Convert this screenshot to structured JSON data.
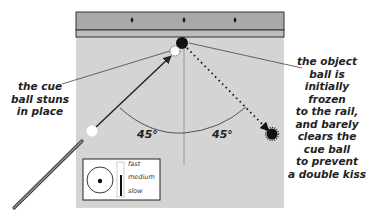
{
  "diagram": {
    "type": "billiards-shot",
    "colors": {
      "background": "#ffffff",
      "felt": "#d4d4d4",
      "rail": "#a9a9a9",
      "cushion": "#bdbdbd",
      "outline": "#333333",
      "object_ball": "#111111",
      "cue_ball": "#ffffff",
      "text": "#222222"
    },
    "rail": {
      "diamonds": 3
    },
    "labels": {
      "left": "the cue ball stuns in place",
      "left_lines": [
        "the cue",
        "ball stuns",
        "in place"
      ],
      "right": "the object ball is initially frozen to the rail, and barely clears the cue ball to prevent a double kiss",
      "right_lines": [
        "the object",
        "ball is",
        "initially frozen",
        "to the rail,",
        "and barely",
        "clears the",
        "cue ball",
        "to prevent",
        "a double kiss"
      ]
    },
    "angles": {
      "left": "45°",
      "right": "45°"
    },
    "legend": {
      "speed_options": [
        "fast",
        "medium",
        "slow"
      ],
      "selected_speed": "medium",
      "tip_position": "center"
    }
  }
}
